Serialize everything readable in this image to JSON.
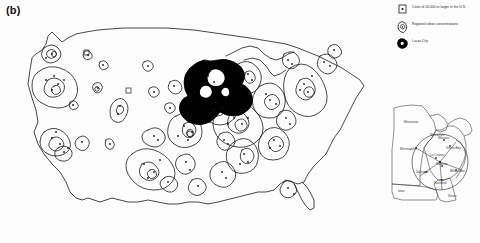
{
  "figure": {
    "panel_label": "(b)"
  },
  "legend": {
    "items": [
      {
        "symbol": "city-point-box-icon",
        "label": "Cities of 20,000 or larger in the U.S."
      },
      {
        "symbol": "urban-contour-icon",
        "label": "Regional urban concentrations"
      },
      {
        "symbol": "study-area-blob-icon",
        "label": "Lucas City"
      }
    ]
  },
  "main_map": {
    "name": "united-states-map",
    "highlight_region_name": "Upper Midwest study area",
    "outline_color": "#1a1a1a",
    "fill_color": "#ffffff",
    "highlight_color": "#000000"
  },
  "inset_map": {
    "name": "upper-midwest-inset-map",
    "states": [
      {
        "label": "Minnesota",
        "x": 26,
        "y": 22
      },
      {
        "label": "Wisconsin",
        "x": 56,
        "y": 36
      },
      {
        "label": "Iowa",
        "x": 20,
        "y": 82
      },
      {
        "label": "Illinois",
        "x": 76,
        "y": 90
      }
    ],
    "cities": [
      {
        "label": "Minneapolis",
        "x": 30,
        "y": 47
      },
      {
        "label": "Green Bay",
        "x": 66,
        "y": 47
      },
      {
        "label": "Wausau",
        "x": 58,
        "y": 42
      },
      {
        "label": "La Crosse",
        "x": 52,
        "y": 57
      },
      {
        "label": "Madison",
        "x": 56,
        "y": 66
      },
      {
        "label": "Milwaukee",
        "x": 68,
        "y": 70
      },
      {
        "label": "Dubuque",
        "x": 40,
        "y": 70
      },
      {
        "label": "Rockford",
        "x": 57,
        "y": 78
      }
    ],
    "circle": {
      "cx": 54,
      "cy": 62,
      "r": 28
    }
  },
  "colors": {
    "ink": "#1a1a1a",
    "paper": "#ffffff",
    "highlight": "#000000",
    "label_gray": "#444444"
  }
}
